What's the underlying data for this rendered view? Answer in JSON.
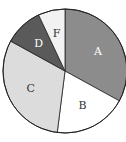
{
  "chart_data": {
    "type": "pie",
    "title": "",
    "categories": [
      "A",
      "B",
      "C",
      "D",
      "F"
    ],
    "values": [
      33,
      19,
      31,
      10,
      7
    ],
    "unit": "percent (estimated)",
    "start_angle_deg": 0,
    "direction": "clockwise",
    "colors": [
      "#8c8c8c",
      "#ffffff",
      "#dcdcdc",
      "#5a5a5a",
      "#f2f2f2"
    ],
    "label_colors": [
      "#ffffff",
      "#333333",
      "#333333",
      "#ffffff",
      "#333333"
    ],
    "legend": "none (labels inside slices)"
  }
}
